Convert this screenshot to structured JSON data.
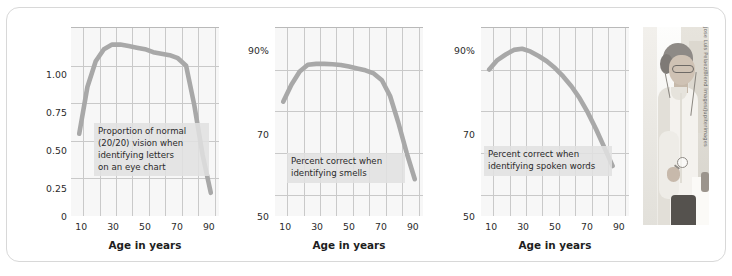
{
  "figure": {
    "panel_border_color": "#d8d8d8",
    "curve_color": "#a8a8a8",
    "plot_background": "#f7f7f7",
    "gridline_color": "#c9c9c9"
  },
  "photo": {
    "alt_name": "elderly-woman-with-magnifying-glass",
    "credit": "Jose Luis Pelaez/Blend Images/Jupiterimages"
  },
  "chart_data": [
    {
      "id": "vision",
      "type": "line",
      "title": "",
      "annotation": "Proportion of normal\n(20/20) vision when\nidentifying letters\non an eye chart",
      "xlabel": "Age in years",
      "ylabel": "",
      "xlim": [
        0,
        90
      ],
      "ylim": [
        0,
        1.25
      ],
      "xticks": [
        10,
        30,
        50,
        70,
        90
      ],
      "xtick_labels": [
        "10",
        "30",
        "50",
        "70",
        "90"
      ],
      "yticks": [
        0,
        0.25,
        0.5,
        0.75,
        1.0
      ],
      "ytick_labels": [
        "0",
        "0.25",
        "0.50",
        "0.75",
        "1.00"
      ],
      "grid": true,
      "x": [
        5,
        10,
        15,
        20,
        25,
        30,
        35,
        40,
        45,
        50,
        55,
        60,
        65,
        70,
        75,
        80,
        85
      ],
      "values": [
        0.55,
        0.86,
        1.03,
        1.11,
        1.14,
        1.14,
        1.13,
        1.12,
        1.11,
        1.09,
        1.08,
        1.07,
        1.05,
        1.0,
        0.74,
        0.41,
        0.16
      ]
    },
    {
      "id": "smell",
      "type": "line",
      "title": "",
      "annotation": "Percent correct when\nidentifying smells",
      "xlabel": "Age in years",
      "ylabel": "",
      "xlim": [
        0,
        90
      ],
      "ylim": [
        50,
        100
      ],
      "xticks": [
        10,
        30,
        50,
        70,
        90
      ],
      "xtick_labels": [
        "10",
        "30",
        "50",
        "70",
        "90"
      ],
      "yticks": [
        50,
        70,
        90
      ],
      "ytick_labels": [
        "50",
        "70",
        "90%"
      ],
      "grid": true,
      "x": [
        5,
        10,
        15,
        20,
        25,
        30,
        35,
        40,
        45,
        50,
        55,
        60,
        65,
        70,
        75,
        80,
        85
      ],
      "values": [
        80.5,
        85.0,
        88.5,
        90.3,
        90.5,
        90.5,
        90.4,
        90.2,
        89.8,
        89.3,
        88.8,
        88.0,
        86.2,
        82.0,
        75.0,
        67.0,
        60.0
      ]
    },
    {
      "id": "hearing",
      "type": "line",
      "title": "",
      "annotation": "Percent correct when\nidentifying spoken words",
      "xlabel": "Age in years",
      "ylabel": "",
      "xlim": [
        0,
        90
      ],
      "ylim": [
        50,
        100
      ],
      "xticks": [
        10,
        30,
        50,
        70,
        90
      ],
      "xtick_labels": [
        "10",
        "30",
        "50",
        "70",
        "90"
      ],
      "yticks": [
        50,
        70,
        90
      ],
      "ytick_labels": [
        "50",
        "70",
        "90%"
      ],
      "grid": true,
      "x": [
        5,
        10,
        15,
        20,
        25,
        30,
        35,
        40,
        45,
        50,
        55,
        60,
        65,
        70,
        75,
        80
      ],
      "values": [
        89.0,
        91.5,
        93.0,
        94.2,
        94.5,
        93.8,
        92.6,
        91.2,
        89.4,
        87.2,
        84.6,
        81.4,
        77.6,
        73.2,
        68.4,
        63.5
      ]
    }
  ]
}
